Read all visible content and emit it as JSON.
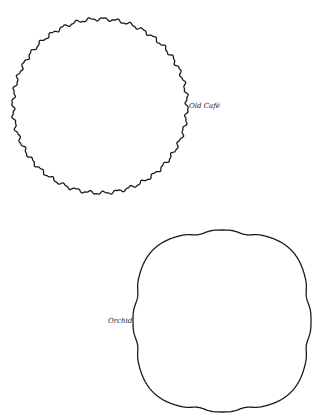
{
  "shapes": [
    {
      "id": "old-cafe",
      "label": "Old Café",
      "kind": "scalloped-circle",
      "cx": 100,
      "cy": 106,
      "r": 87,
      "ripples": 40,
      "ripple_amp": 1.4
    },
    {
      "id": "orchid",
      "label": "Orchid",
      "kind": "rounded-square-with-bumps",
      "cx": 222,
      "cy": 321,
      "half_w": 86,
      "half_h": 88,
      "superellipse_n": 3.2,
      "bump_amp": 3,
      "bump_width": 0.12
    }
  ],
  "colors": {
    "stroke": "#1a1a1a",
    "label": "#222222",
    "background": "#ffffff"
  }
}
